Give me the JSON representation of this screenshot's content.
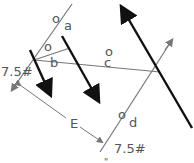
{
  "diagram": {
    "type": "force-polygon",
    "labels": {
      "a": "a",
      "b": "b",
      "c": "c",
      "d": "d",
      "E": "E",
      "o_a": "o",
      "o_b": "o",
      "o_c": "o",
      "o_d": "o",
      "force_left": "7.5#",
      "force_right": "7.5#",
      "bottom_partial": "\""
    },
    "colors": {
      "heavy_arrow": "#111111",
      "thin_line": "#777777",
      "text": "#555555"
    }
  }
}
